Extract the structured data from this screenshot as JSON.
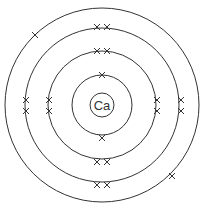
{
  "diagram": {
    "nucleus": {
      "symbol": "Ca"
    },
    "shells": [
      {
        "n": 1,
        "electrons": 2
      },
      {
        "n": 2,
        "electrons": 8
      },
      {
        "n": 3,
        "electrons": 8
      },
      {
        "n": 4,
        "electrons": 2
      }
    ],
    "electron_marker": "×",
    "line_color": "#333333"
  }
}
